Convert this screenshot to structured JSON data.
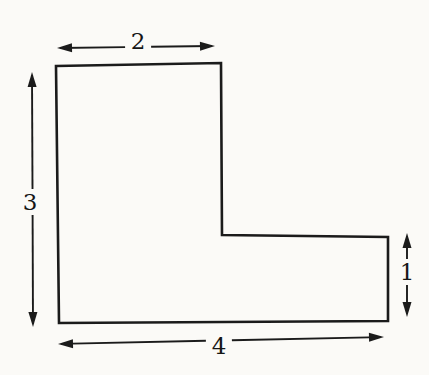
{
  "figure": {
    "background_color": "#fbfaf7",
    "line_color": "#1b1b1b",
    "shape": {
      "type": "L-shaped polygon",
      "outline_stroke_width": 2.6,
      "vertices": [
        [
          56,
          66
        ],
        [
          221,
          63
        ],
        [
          222,
          235
        ],
        [
          388,
          237
        ],
        [
          388,
          321
        ],
        [
          59,
          323
        ]
      ]
    },
    "dimensions": [
      {
        "side": "top",
        "label": "2",
        "from": [
          57,
          48
        ],
        "to": [
          215,
          46
        ],
        "label_pos": [
          138,
          41
        ]
      },
      {
        "side": "left",
        "label": "3",
        "from": [
          32,
          72
        ],
        "to": [
          33,
          327
        ],
        "label_pos": [
          30,
          202
        ]
      },
      {
        "side": "right",
        "label": "1",
        "from": [
          407,
          233
        ],
        "to": [
          407,
          317
        ],
        "label_pos": [
          407,
          272
        ]
      },
      {
        "side": "bottom",
        "label": "4",
        "from": [
          58,
          344
        ],
        "to": [
          384,
          337
        ],
        "label_pos": [
          219,
          346
        ]
      }
    ]
  }
}
